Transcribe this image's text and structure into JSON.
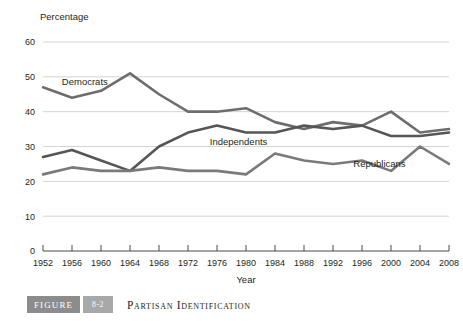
{
  "figure": {
    "label": "FIGURE",
    "number": "8-2",
    "title": "Partisan Identification"
  },
  "chart_data": {
    "type": "line",
    "title": "Partisan Identification",
    "xlabel": "Year",
    "ylabel": "Percentage",
    "ylim": [
      0,
      60
    ],
    "yticks": [
      0,
      10,
      20,
      30,
      40,
      50,
      60
    ],
    "grid": true,
    "legend": "inline-labels",
    "categories": [
      1952,
      1956,
      1960,
      1964,
      1968,
      1972,
      1976,
      1980,
      1984,
      1988,
      1992,
      1996,
      2000,
      2004,
      2008
    ],
    "xtick_labels": [
      "1952",
      "1956",
      "1960",
      "1964",
      "1968",
      "1972",
      "1976",
      "1980",
      "1984",
      "1988",
      "1992",
      "1996",
      "2000",
      "2004",
      "2008"
    ],
    "series": [
      {
        "name": "Democrats",
        "color": "#6d6d6d",
        "values": [
          47,
          44,
          46,
          51,
          45,
          40,
          40,
          41,
          37,
          35,
          37,
          36,
          40,
          34,
          35
        ]
      },
      {
        "name": "Independents",
        "color": "#565656",
        "values": [
          27,
          29,
          26,
          23,
          30,
          34,
          36,
          34,
          34,
          36,
          35,
          36,
          33,
          33,
          34
        ]
      },
      {
        "name": "Republicans",
        "color": "#7a7a7a",
        "values": [
          22,
          24,
          23,
          23,
          24,
          23,
          23,
          22,
          28,
          26,
          25,
          26,
          23,
          30,
          25
        ]
      }
    ],
    "annotations": [
      {
        "text": "Democrats",
        "x": 1954.6,
        "y": 47.6
      },
      {
        "text": "Independents",
        "x": 1975.0,
        "y": 30.3
      },
      {
        "text": "Republicans",
        "x": 1994.8,
        "y": 24.0
      }
    ]
  }
}
